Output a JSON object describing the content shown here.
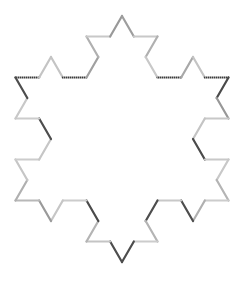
{
  "figure": {
    "kind": "koch-snowflake",
    "iterations": 2,
    "segment_count": 48,
    "center": {
      "x": 122,
      "y": 139
    },
    "radius": 123,
    "stroke_width": 2.2,
    "background_color": "#ffffff",
    "dither_dark_color": "#3c3c3c",
    "dither_light_color": "#9a9a9a",
    "path_start": "upper-left-tip",
    "path_direction": "clockwise",
    "segment_colors": [
      "dither",
      "#c4c4c4",
      "#c4c4c4",
      "dither",
      "#a0a0a0",
      "#b0b0b0",
      "#c8c8c8",
      "#999999",
      "#9e9e9e",
      "#c8c8c8",
      "#b0b0b0",
      "#c8c8c8",
      "dither",
      "#a8a8a8",
      "#c4c4c4",
      "dither",
      "#4a4a4a",
      "#989898",
      "#c8c8c8",
      "#c4c4c4",
      "#4a4a4a",
      "#c8c8c8",
      "#c8c8c8",
      "#b4b4b4",
      "#cccccc",
      "#b0b0b0",
      "#4d4d4d",
      "#c8c8c8",
      "#4d4d4d",
      "#b4b4b4",
      "#cccccc",
      "#4d4d4d",
      "#4d4d4d",
      "#c4c4c4",
      "#b4b4b4",
      "#4a4a4a",
      "#cccccc",
      "#c6c6c6",
      "#9a9a9a",
      "#b8b8b8",
      "#b0b0b0",
      "#c6c6c6",
      "#cccccc",
      "#c6c6c6",
      "#4d4d4d",
      "#cccccc",
      "#c8c8c8",
      "#4d4d4d"
    ]
  }
}
